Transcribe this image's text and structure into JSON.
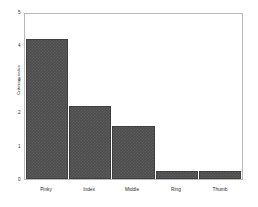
{
  "chart_data": {
    "type": "bar",
    "title": "",
    "xlabel": "",
    "ylabel": "Criterion value",
    "categories": [
      "Pinky",
      "Index",
      "Middle",
      "Ring",
      "Thumb"
    ],
    "values": [
      4.25,
      2.2,
      1.6,
      0.25,
      0.23
    ],
    "ylim": [
      0,
      5
    ],
    "yticks": [
      0,
      1,
      2,
      3,
      4,
      5
    ],
    "ytick_labels": [
      "0",
      "1",
      "2",
      "3",
      "4",
      "5"
    ],
    "grid": false,
    "legend": null,
    "bar_color": "#4c4c4c",
    "axis_color": "#b9b9b9",
    "background": "#ffffff"
  }
}
